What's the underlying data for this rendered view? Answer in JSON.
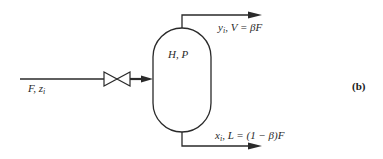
{
  "diagram": {
    "type": "flash-drum-process-diagram",
    "panel_label": "(b)",
    "feed": {
      "label_main": "F, z",
      "label_sub": "i"
    },
    "vessel": {
      "label": "H, P"
    },
    "vapor_outlet": {
      "label_var": "y",
      "label_sub": "i",
      "label_rest": ", V = βF"
    },
    "liquid_outlet": {
      "label_var": "x",
      "label_sub": "i",
      "label_rest": ", L = (1 − β)F"
    },
    "icons": {
      "valve": "bowtie-valve-icon",
      "arrow": "arrowhead-icon"
    },
    "colors": {
      "ink": "#2a2a2a",
      "background": "#ffffff"
    }
  }
}
